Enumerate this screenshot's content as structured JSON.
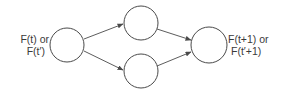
{
  "diagram": {
    "type": "directed-graph",
    "nodes": [
      {
        "id": "input",
        "cx": 67,
        "cy": 45,
        "r": 17
      },
      {
        "id": "upper-middle",
        "cx": 141,
        "cy": 23,
        "r": 17
      },
      {
        "id": "lower-middle",
        "cx": 141,
        "cy": 71,
        "r": 17
      },
      {
        "id": "output",
        "cx": 209,
        "cy": 45,
        "r": 18
      }
    ],
    "edges": [
      {
        "from": "input",
        "to": "upper-middle"
      },
      {
        "from": "input",
        "to": "lower-middle"
      },
      {
        "from": "upper-middle",
        "to": "output"
      },
      {
        "from": "lower-middle",
        "to": "output"
      }
    ],
    "labels": {
      "input": {
        "line1": "F(t) or",
        "line2": "F(t′)"
      },
      "output": {
        "line1": "F(t+1) or",
        "line2": "F(t′+1)"
      }
    },
    "colors": {
      "stroke": "#4a4a4a",
      "text": "#3a3a3a",
      "background": "#ffffff"
    }
  }
}
